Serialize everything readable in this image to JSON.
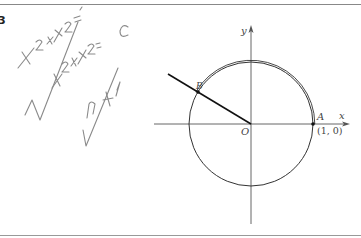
{
  "figure": {
    "corner_mark": "3",
    "axes": {
      "x_label": "x",
      "y_label": "y",
      "origin_label": "O"
    },
    "points": {
      "A": {
        "label": "A",
        "coords_label": "(1, 0)"
      },
      "B": {
        "label": "B"
      }
    },
    "handwriting": {
      "line1": "x²+y²=",
      "line2": "√(x²+y²) = c",
      "line3": "√(…+1)"
    },
    "colors": {
      "ink": "#222222",
      "axis": "#555555",
      "border": "#888888",
      "pencil": "#8a8a8a"
    }
  }
}
